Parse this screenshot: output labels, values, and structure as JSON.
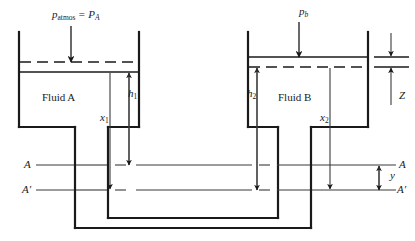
{
  "figure": {
    "type": "engineering-schematic"
  },
  "labels": {
    "p_atmos": {
      "base": "p",
      "sub": "atmos",
      "eq": "=",
      "base2": "P",
      "sub2": "A"
    },
    "p_b": {
      "base": "p",
      "sub": "b"
    },
    "fluid_a": "Fluid A",
    "fluid_b": "Fluid B",
    "h1": {
      "base": "h",
      "sub": "1"
    },
    "h2": {
      "base": "h",
      "sub": "2"
    },
    "x1": {
      "base": "x",
      "sub": "1"
    },
    "x2": {
      "base": "x",
      "sub": "2"
    },
    "z": "Z",
    "y": "y",
    "datum_a_left": "A",
    "datum_a_prime_left": "A′",
    "datum_a_right": "A",
    "datum_a_prime_right": "A′"
  },
  "colors": {
    "line": "#1a1a1a",
    "thin_line": "#3a3a3a",
    "background": "#ffffff"
  },
  "geometry": {
    "left_tank": {
      "x_left": 18,
      "x_right": 140,
      "y_top": 32,
      "y_bottom": 128
    },
    "right_tank": {
      "x_left": 247,
      "x_right": 369,
      "y_top": 32,
      "y_bottom": 128
    },
    "left_surface_dashed_y": 62,
    "left_surface_solid_y": 72,
    "right_surface_solid_y": 57,
    "right_surface_dashed_y": 67,
    "datum_a_y": 165,
    "datum_a_prime_y": 190,
    "tube_bottom_outer_y": 228,
    "tube_bottom_inner_y": 218
  }
}
